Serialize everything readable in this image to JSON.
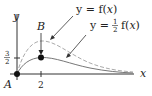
{
  "diagram": {
    "axes": {
      "x_label": "x",
      "y_label": "y"
    },
    "ticks": {
      "x_tick": "2",
      "y_tick_num": "3",
      "y_tick_den": "2"
    },
    "points": [
      {
        "name": "A",
        "label": "A"
      },
      {
        "name": "B",
        "label": "B"
      }
    ],
    "curves": [
      {
        "name": "f",
        "style": "dashed",
        "color": "#aaaaaa",
        "label_left": "y = f(",
        "label_var": "x",
        "label_right": ")"
      },
      {
        "name": "half-f",
        "style": "solid",
        "color": "#777777",
        "label_left": "y = ",
        "label_frac_num": "1",
        "label_frac_den": "2",
        "label_mid": "f(",
        "label_var": "x",
        "label_right": ")"
      }
    ]
  }
}
